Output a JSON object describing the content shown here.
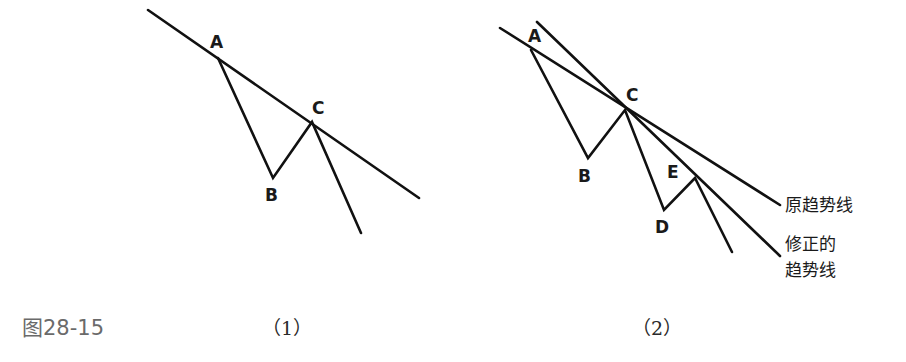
{
  "figure": {
    "caption": "图28-15",
    "panels": [
      {
        "id": "panel-1",
        "caption": "（1）",
        "points": {
          "A": "A",
          "B": "B",
          "C": "C"
        },
        "lines": {
          "trendline": [
            [
              148,
              10
            ],
            [
              419,
              198
            ]
          ],
          "price_path": [
            [
              218,
              58
            ],
            [
              273,
              178
            ],
            [
              312,
              122
            ],
            [
              361,
              233
            ]
          ]
        }
      },
      {
        "id": "panel-2",
        "caption": "（2）",
        "points": {
          "A": "A",
          "B": "B",
          "C": "C",
          "D": "D",
          "E": "E"
        },
        "labels": {
          "original_trendline": "原趋势线",
          "revised_trendline_line1": "修正的",
          "revised_trendline_line2": "趋势线"
        },
        "lines": {
          "original_trendline": [
            [
              500,
              28
            ],
            [
              780,
              205
            ]
          ],
          "revised_trendline": [
            [
              537,
              22
            ],
            [
              780,
              256
            ]
          ],
          "price_path": [
            [
              531,
              50
            ],
            [
              588,
              158
            ],
            [
              625,
              110
            ],
            [
              664,
              210
            ],
            [
              695,
              178
            ],
            [
              732,
              252
            ]
          ]
        }
      }
    ],
    "colors": {
      "line": "#111111",
      "background": "#ffffff",
      "caption": "#6a6a6a"
    }
  }
}
